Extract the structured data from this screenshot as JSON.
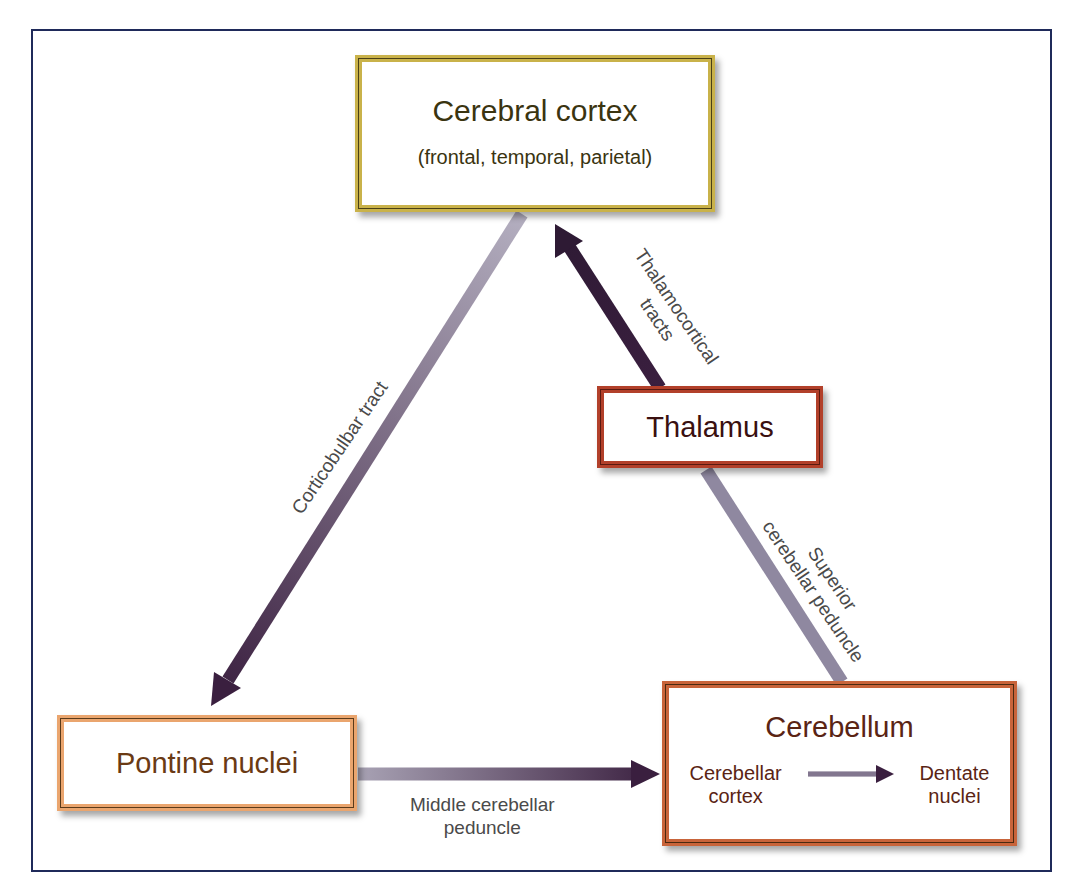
{
  "diagram": {
    "colors": {
      "frame": "#1f2a5a",
      "cortex_border": "#c9b24a",
      "thalamus_border": "#b2402a",
      "pontine_border": "#eaa56e",
      "cerebellum_border": "#c8643a",
      "arrow_dark": "#3a1f3f",
      "arrow_light": "#9a94a8"
    },
    "nodes": {
      "cortex": {
        "label": "Cerebral cortex",
        "sublabel": "(frontal, temporal, parietal)"
      },
      "thalamus": {
        "label": "Thalamus"
      },
      "pontine": {
        "label": "Pontine nuclei"
      },
      "cerebellum": {
        "label": "Cerebellum",
        "internal_from": [
          "Cerebellar",
          "cortex"
        ],
        "internal_to": [
          "Dentate",
          "nuclei"
        ]
      }
    },
    "edges": [
      {
        "from": "Cerebral cortex",
        "to": "Pontine nuclei",
        "label": "Corticobulbar tract"
      },
      {
        "from": "Pontine nuclei",
        "to": "Cerebellum",
        "label_line1": "Middle cerebellar",
        "label_line2": "peduncle"
      },
      {
        "from": "Cerebellum",
        "to": "Thalamus",
        "label_line1": "Superior",
        "label_line2": "cerebellar peduncle"
      },
      {
        "from": "Thalamus",
        "to": "Cerebral cortex",
        "label_line1": "Thalamocortical",
        "label_line2": "tracts"
      }
    ]
  }
}
